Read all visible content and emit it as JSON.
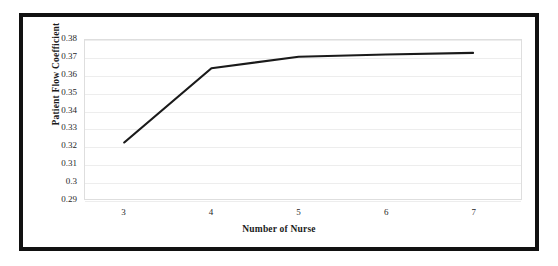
{
  "figure": {
    "border_color": "#111111",
    "background": "#ffffff"
  },
  "chart_data": {
    "type": "line",
    "title": "",
    "subtitle": "",
    "xlabel": "Number of Nurse",
    "ylabel": "Patient Flow Coefficient",
    "categories": [
      3,
      4,
      5,
      6,
      7
    ],
    "x": [
      3,
      4,
      5,
      6,
      7
    ],
    "values": [
      0.322,
      0.364,
      0.3705,
      0.3718,
      0.3727
    ],
    "series": [
      {
        "name": "Patient Flow Coefficient",
        "values": [
          0.322,
          0.364,
          0.3705,
          0.3718,
          0.3727
        ],
        "color": "#1a1a1a",
        "line_width": 2.2,
        "markers": false
      }
    ],
    "xlim": [
      2.55,
      7.55
    ],
    "ylim": [
      0.29,
      0.38
    ],
    "ytick_labels": [
      "0.38",
      "0.37",
      "0.36",
      "0.35",
      "0.34",
      "0.33",
      "0.32",
      "0.31",
      "0.3",
      "0.29"
    ],
    "ytick_values": [
      0.38,
      0.37,
      0.36,
      0.35,
      0.34,
      0.33,
      0.32,
      0.31,
      0.3,
      0.29
    ],
    "xtick_labels": [
      "3",
      "4",
      "5",
      "6",
      "7"
    ],
    "xtick_values": [
      3,
      4,
      5,
      6,
      7
    ],
    "grid": true,
    "grid_axis": "y",
    "grid_color": "#ededed",
    "legend": false,
    "legend_position": "none",
    "plot_border_color": "#dedede"
  }
}
